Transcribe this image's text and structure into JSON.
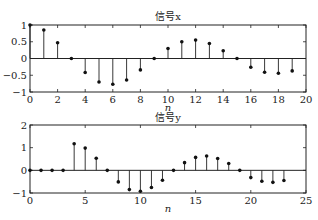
{
  "chart_data": [
    {
      "type": "stem",
      "title": "信号x",
      "xlabel": "n",
      "ylabel": "",
      "xlim": [
        0,
        20
      ],
      "ylim": [
        -1,
        1
      ],
      "xticks": [
        0,
        2,
        4,
        6,
        8,
        10,
        12,
        14,
        16,
        18,
        20
      ],
      "yticks": [
        -1,
        -0.5,
        0,
        0.5,
        1
      ],
      "ytick_labels": [
        "-1",
        "-0.5",
        "0",
        "0.5",
        "1"
      ],
      "grid": false,
      "x": [
        0,
        1,
        2,
        3,
        4,
        5,
        6,
        7,
        8,
        9,
        10,
        11,
        12,
        13,
        14,
        15,
        16,
        17,
        18,
        19
      ],
      "values": [
        1.0,
        0.85,
        0.47,
        0.0,
        -0.42,
        -0.7,
        -0.77,
        -0.64,
        -0.34,
        0.0,
        0.3,
        0.5,
        0.55,
        0.45,
        0.23,
        0.0,
        -0.26,
        -0.41,
        -0.44,
        -0.37
      ]
    },
    {
      "type": "stem",
      "title": "信号y",
      "xlabel": "n",
      "ylabel": "",
      "xlim": [
        0,
        25
      ],
      "ylim": [
        -1,
        2
      ],
      "xticks": [
        0,
        5,
        10,
        15,
        20,
        25
      ],
      "yticks": [
        -1,
        0,
        1,
        2
      ],
      "ytick_labels": [
        "-1",
        "0",
        "1",
        "2"
      ],
      "grid": false,
      "x": [
        0,
        1,
        2,
        3,
        4,
        5,
        6,
        7,
        8,
        9,
        10,
        11,
        12,
        13,
        14,
        15,
        16,
        17,
        18,
        19,
        20,
        21,
        22,
        23
      ],
      "values": [
        0,
        0,
        0,
        0,
        1.17,
        0.98,
        0.53,
        0.0,
        -0.51,
        -0.85,
        -0.92,
        -0.76,
        -0.44,
        0.0,
        0.34,
        0.57,
        0.63,
        0.52,
        0.3,
        0.0,
        -0.32,
        -0.48,
        -0.53,
        -0.45
      ]
    }
  ],
  "layout": {
    "plots": [
      {
        "left": 30,
        "right": 306,
        "top": 25,
        "bottom": 92,
        "title_y": 20,
        "xlabel_y": 111
      },
      {
        "left": 30,
        "right": 306,
        "top": 125,
        "bottom": 193,
        "title_y": 121,
        "xlabel_y": 212
      }
    ],
    "colors": {
      "axis": "#222222",
      "stem": "#222222",
      "marker": "#111111"
    }
  }
}
